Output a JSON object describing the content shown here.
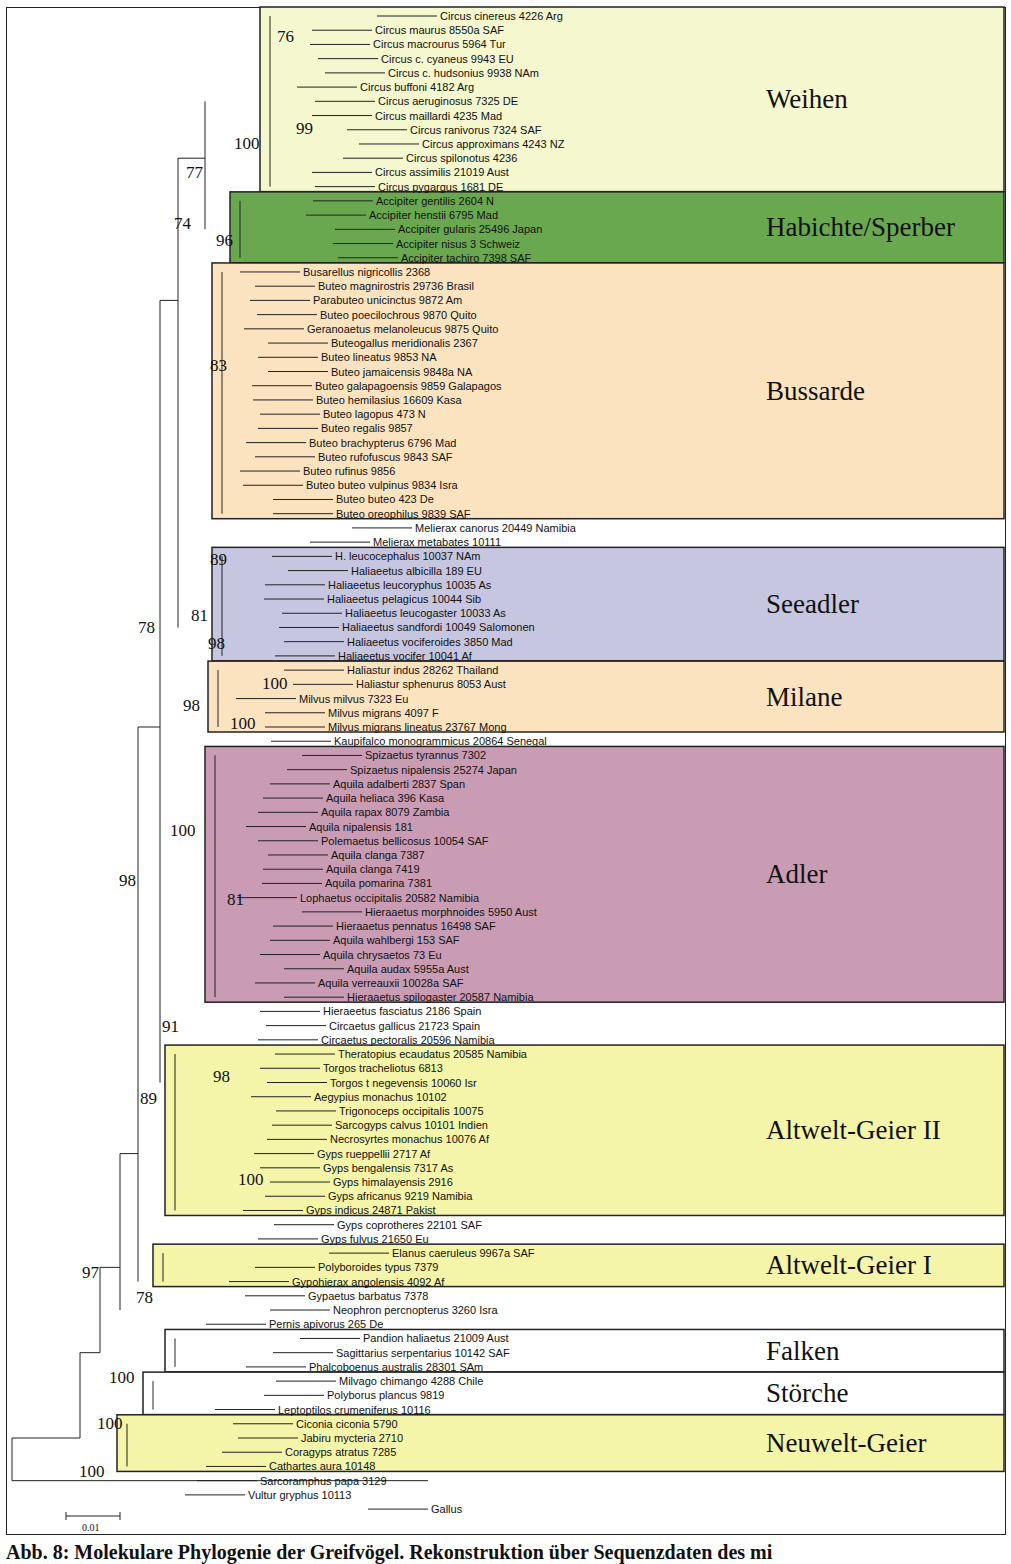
{
  "figure": {
    "caption": "Abb. 8: Molekulare Phylogenie der Greifvögel. Rekonstruktion über Sequenzdaten des mi",
    "scale_bar_label": "0.01",
    "outgroup": "Gallus"
  },
  "groups": [
    {
      "name": "Weihen",
      "color": "#f5f7cf",
      "first": 0,
      "last": 12,
      "box_left": 260
    },
    {
      "name": "Habichte/Sperber",
      "color": "#6aa84f",
      "first": 13,
      "last": 17,
      "box_left": 230
    },
    {
      "name": "Bussarde",
      "color": "#fbe3c0",
      "first": 18,
      "last": 35,
      "box_left": 212
    },
    {
      "name": "Seeadler",
      "color": "#c7c6e0",
      "first": 38,
      "last": 45,
      "box_left": 212
    },
    {
      "name": "Milane",
      "color": "#fbe3c0",
      "first": 46,
      "last": 50,
      "box_left": 208
    },
    {
      "name": "Adler",
      "color": "#c99cb4",
      "first": 52,
      "last": 69,
      "box_left": 205
    },
    {
      "name": "Altwelt-Geier II",
      "color": "#f4f5a8",
      "first": 73,
      "last": 84,
      "box_left": 165
    },
    {
      "name": "Altwelt-Geier I",
      "color": "#f4f5a8",
      "first": 87,
      "last": 89,
      "box_left": 153
    },
    {
      "name": "Falken",
      "color": "#ffffff",
      "first": 93,
      "last": 95,
      "box_left": 165
    },
    {
      "name": "Störche",
      "color": "#ffffff",
      "first": 96,
      "last": 98,
      "box_left": 143
    },
    {
      "name": "Neuwelt-Geier",
      "color": "#f4f5a8",
      "first": 99,
      "last": 102,
      "box_left": 117
    }
  ],
  "taxa": [
    {
      "label": "Circus cinereus 4226 Arg",
      "x": 437
    },
    {
      "label": "Circus maurus 8550a SAF",
      "x": 372
    },
    {
      "label": "Circus macrourus 5964 Tur",
      "x": 370
    },
    {
      "label": "Circus c. cyaneus 9943 EU",
      "x": 378
    },
    {
      "label": "Circus c. hudsonius 9938 NAm",
      "x": 385
    },
    {
      "label": "Circus buffoni 4182 Arg",
      "x": 357
    },
    {
      "label": "Circus aeruginosus 7325 DE",
      "x": 375
    },
    {
      "label": "Circus maillardi 4235 Mad",
      "x": 372
    },
    {
      "label": "Circus ranivorus 7324 SAF",
      "x": 407
    },
    {
      "label": "Circus approximans 4243 NZ",
      "x": 419
    },
    {
      "label": "Circus spilonotus 4236",
      "x": 403
    },
    {
      "label": "Circus assimilis 21019 Aust",
      "x": 372
    },
    {
      "label": "Circus pygargus 1681 DE",
      "x": 375
    },
    {
      "label": "Accipiter gentilis 2604 N",
      "x": 373
    },
    {
      "label": "Accipiter henstii 6795 Mad",
      "x": 366
    },
    {
      "label": "Accipiter gularis 25496 Japan",
      "x": 395
    },
    {
      "label": "Accipiter nisus 3 Schweiz",
      "x": 393
    },
    {
      "label": "Accipiter tachiro 7398 SAF",
      "x": 398
    },
    {
      "label": "Busarellus nigricollis 2368",
      "x": 300
    },
    {
      "label": "Buteo magnirostris 29736 Brasil",
      "x": 315
    },
    {
      "label": "Parabuteo unicinctus 9872 Am",
      "x": 310
    },
    {
      "label": "Buteo poecilochrous 9870 Quito",
      "x": 317
    },
    {
      "label": "Geranoaetus melanoleucus 9875 Quito",
      "x": 304
    },
    {
      "label": "Buteogallus meridionalis 2367",
      "x": 328
    },
    {
      "label": "Buteo lineatus 9853 NA",
      "x": 318
    },
    {
      "label": "Buteo jamaicensis 9848a NA",
      "x": 328
    },
    {
      "label": "Buteo galapagoensis 9859 Galapagos",
      "x": 312
    },
    {
      "label": "Buteo hemilasius 16609 Kasa",
      "x": 313
    },
    {
      "label": "Buteo lagopus 473 N",
      "x": 320
    },
    {
      "label": "Buteo regalis 9857",
      "x": 318
    },
    {
      "label": "Buteo brachypterus 6796 Mad",
      "x": 306
    },
    {
      "label": "Buteo rufofuscus 9843 SAF",
      "x": 315
    },
    {
      "label": "Buteo rufinus 9856",
      "x": 300
    },
    {
      "label": "Buteo buteo vulpinus 9834 Isra",
      "x": 303
    },
    {
      "label": "Buteo buteo 423 De",
      "x": 333
    },
    {
      "label": "Buteo oreophilus 9839 SAF",
      "x": 333
    },
    {
      "label": "Melierax canorus 20449 Namibia",
      "x": 412
    },
    {
      "label": "Melierax metabates 10111",
      "x": 370
    },
    {
      "label": "H. leucocephalus 10037 NAm",
      "x": 332
    },
    {
      "label": "Haliaeetus albicilla 189 EU",
      "x": 348
    },
    {
      "label": "Haliaeetus leucoryphus 10035 As",
      "x": 325
    },
    {
      "label": "Haliaeetus pelagicus 10044 Sib",
      "x": 324
    },
    {
      "label": "Haliaeetus leucogaster 10033 As",
      "x": 342
    },
    {
      "label": "Haliaeetus sandfordi 10049 Salomonen",
      "x": 339
    },
    {
      "label": "Haliaeetus vociferoides 3850 Mad",
      "x": 344
    },
    {
      "label": "Haliaeetus vocifer 10041 Af",
      "x": 335
    },
    {
      "label": "Haliastur indus 28262 Thailand",
      "x": 344
    },
    {
      "label": "Haliastur sphenurus 8053 Aust",
      "x": 353
    },
    {
      "label": "Milvus milvus 7323 Eu",
      "x": 296
    },
    {
      "label": "Milvus migrans 4097 F",
      "x": 325
    },
    {
      "label": "Milvus migrans lineatus 23767 Mong",
      "x": 325
    },
    {
      "label": "Kaupifalco monogrammicus 20864 Senegal",
      "x": 331
    },
    {
      "label": "Spizaetus tyrannus 7302",
      "x": 362
    },
    {
      "label": "Spizaetus nipalensis 25274 Japan",
      "x": 347
    },
    {
      "label": "Aquila adalberti 2837 Span",
      "x": 330
    },
    {
      "label": "Aquila heliaca 396 Kasa",
      "x": 323
    },
    {
      "label": "Aquila rapax 8079 Zambia",
      "x": 318
    },
    {
      "label": "Aquila nipalensis 181",
      "x": 306
    },
    {
      "label": "Polemaetus bellicosus 10054 SAF",
      "x": 318
    },
    {
      "label": "Aquila clanga 7387",
      "x": 328
    },
    {
      "label": "Aquila clanga 7419",
      "x": 323
    },
    {
      "label": "Aquila pomarina 7381",
      "x": 322
    },
    {
      "label": "Lophaetus occipitalis 20582 Namibia",
      "x": 297
    },
    {
      "label": "Hieraaetus morphnoides 5950 Aust",
      "x": 362
    },
    {
      "label": "Hieraaetus pennatus 16498 SAF",
      "x": 333
    },
    {
      "label": "Aquila wahlbergi 153 SAF",
      "x": 330
    },
    {
      "label": "Aquila chrysaetos 73 Eu",
      "x": 320
    },
    {
      "label": "Aquila audax 5955a Aust",
      "x": 344
    },
    {
      "label": "Aquila verreauxii 10028a SAF",
      "x": 315
    },
    {
      "label": "Hieraaetus spilogaster 20587 Namibia",
      "x": 344
    },
    {
      "label": "Hieraeetus fasciatus 2186 Spain",
      "x": 320
    },
    {
      "label": "Circaetus gallicus 21723 Spain",
      "x": 326
    },
    {
      "label": "Circaetus pectoralis 20596 Namibia",
      "x": 318
    },
    {
      "label": "Theratopius ecaudatus 20585 Namibia",
      "x": 335
    },
    {
      "label": "Torgos tracheliotus 6813",
      "x": 320
    },
    {
      "label": "Torgos t negevensis 10060 Isr",
      "x": 327
    },
    {
      "label": "Aegypius monachus 10102",
      "x": 311
    },
    {
      "label": "Trigonoceps occipitalis 10075",
      "x": 336
    },
    {
      "label": "Sarcogyps calvus 10101 Indien",
      "x": 332
    },
    {
      "label": "Necrosyrtes monachus 10076 Af",
      "x": 327
    },
    {
      "label": "Gyps rueppellii 2717 Af",
      "x": 314
    },
    {
      "label": "Gyps bengalensis 7317 As",
      "x": 320
    },
    {
      "label": "Gyps himalayensis 2916",
      "x": 330
    },
    {
      "label": "Gyps africanus 9219 Namibia",
      "x": 325
    },
    {
      "label": "Gyps indicus 24871 Pakist",
      "x": 303
    },
    {
      "label": "Gyps coprotheres 22101 SAF",
      "x": 334
    },
    {
      "label": "Gyps fulvus 21650 Eu",
      "x": 318
    },
    {
      "label": "Elanus caeruleus 9967a SAF",
      "x": 389
    },
    {
      "label": "Polyboroides typus 7379",
      "x": 315
    },
    {
      "label": "Gypohierax angolensis 4092 Af",
      "x": 289
    },
    {
      "label": "Gypaetus barbatus 7378",
      "x": 305
    },
    {
      "label": "Neophron percnopterus 3260 Isra",
      "x": 330
    },
    {
      "label": "Pernis apivorus 265 De",
      "x": 266
    },
    {
      "label": "Pandion haliaetus 21009 Aust",
      "x": 360
    },
    {
      "label": "Sagittarius serpentarius 10142 SAF",
      "x": 333
    },
    {
      "label": "Phalcoboenus australis 28301 SAm",
      "x": 306
    },
    {
      "label": "Milvago chimango 4288 Chile",
      "x": 336
    },
    {
      "label": "Polyborus plancus 9819",
      "x": 324
    },
    {
      "label": "Leptoptilos crumeniferus 10116",
      "x": 275
    },
    {
      "label": "Ciconia ciconia 5790",
      "x": 293
    },
    {
      "label": "Jabiru mycteria 2710",
      "x": 298
    },
    {
      "label": "Coragyps atratus 7285",
      "x": 282
    },
    {
      "label": "Cathartes aura 10148",
      "x": 266
    },
    {
      "label": "Sarcoramphus papa 3129",
      "x": 257
    },
    {
      "label": "Vultur gryphus 10113",
      "x": 245
    },
    {
      "label": "Gallus",
      "x": 428
    }
  ],
  "bootstrap": [
    {
      "value": "76",
      "x": 287,
      "y": 36
    },
    {
      "value": "99",
      "x": 306,
      "y": 128
    },
    {
      "value": "100",
      "x": 244,
      "y": 143
    },
    {
      "value": "77",
      "x": 196,
      "y": 172
    },
    {
      "value": "74",
      "x": 184,
      "y": 223
    },
    {
      "value": "96",
      "x": 226,
      "y": 240
    },
    {
      "value": "83",
      "x": 220,
      "y": 365
    },
    {
      "value": "89",
      "x": 220,
      "y": 559
    },
    {
      "value": "81",
      "x": 201,
      "y": 615
    },
    {
      "value": "78",
      "x": 148,
      "y": 627
    },
    {
      "value": "98",
      "x": 218,
      "y": 643
    },
    {
      "value": "100",
      "x": 272,
      "y": 683
    },
    {
      "value": "98",
      "x": 193,
      "y": 705
    },
    {
      "value": "100",
      "x": 240,
      "y": 723
    },
    {
      "value": "100",
      "x": 180,
      "y": 830
    },
    {
      "value": "98",
      "x": 129,
      "y": 880
    },
    {
      "value": "81",
      "x": 237,
      "y": 899
    },
    {
      "value": "91",
      "x": 172,
      "y": 1026
    },
    {
      "value": "98",
      "x": 223,
      "y": 1076
    },
    {
      "value": "89",
      "x": 150,
      "y": 1098
    },
    {
      "value": "100",
      "x": 248,
      "y": 1179
    },
    {
      "value": "97",
      "x": 92,
      "y": 1272
    },
    {
      "value": "78",
      "x": 146,
      "y": 1297
    },
    {
      "value": "100",
      "x": 119,
      "y": 1377
    },
    {
      "value": "100",
      "x": 107,
      "y": 1423
    },
    {
      "value": "100",
      "x": 89,
      "y": 1471
    }
  ]
}
